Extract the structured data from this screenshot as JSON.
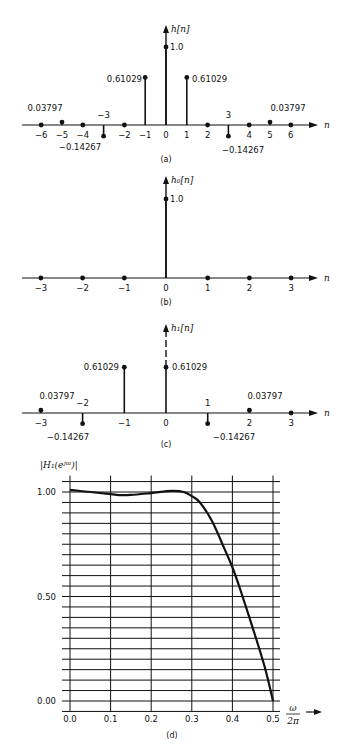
{
  "figure": {
    "panels": [
      {
        "id": "a",
        "caption": "(a)",
        "ylabel": "h[n]",
        "xlabel": "n",
        "peak_label": "1.0"
      },
      {
        "id": "b",
        "caption": "(b)",
        "ylabel": "h₀[n]",
        "xlabel": "n",
        "peak_label": "1.0"
      },
      {
        "id": "c",
        "caption": "(c)",
        "ylabel": "h₁[n]",
        "xlabel": "n"
      },
      {
        "id": "d",
        "caption": "(d)",
        "ylabel": "|H₁(eʲᵚ)|",
        "xlabel_num": "ω",
        "xlabel_den": "2π"
      }
    ]
  },
  "chart_data": [
    {
      "type": "stem",
      "title": "(a)",
      "ylabel": "h[n]",
      "xlabel": "n",
      "x": [
        -6,
        -5,
        -4,
        -3,
        -2,
        -1,
        0,
        1,
        2,
        3,
        4,
        5,
        6
      ],
      "values": [
        0,
        0.03797,
        0,
        -0.14267,
        0,
        0.61029,
        1.0,
        0.61029,
        0,
        -0.14267,
        0,
        0.03797,
        0
      ],
      "annotations": [
        "0.03797",
        "-0.14267",
        "0.61029",
        "1.0",
        "0.61029",
        "-0.14267",
        "0.03797",
        "-3",
        "3"
      ],
      "tick_labels": [
        "-6",
        "-5",
        "-4",
        "-2",
        "-1",
        "0",
        "1",
        "2",
        "4",
        "5",
        "6"
      ]
    },
    {
      "type": "stem",
      "title": "(b)",
      "ylabel": "h0[n]",
      "xlabel": "n",
      "x": [
        -3,
        -2,
        -1,
        0,
        1,
        2,
        3
      ],
      "values": [
        0,
        0,
        0,
        1.0,
        0,
        0,
        0
      ],
      "annotations": [
        "1.0"
      ],
      "tick_labels": [
        "-3",
        "-2",
        "-1",
        "0",
        "1",
        "2",
        "3"
      ]
    },
    {
      "type": "stem",
      "title": "(c)",
      "ylabel": "h1[n]",
      "xlabel": "n",
      "x": [
        -3,
        -2,
        -1,
        0,
        1,
        2,
        3
      ],
      "values": [
        0.03797,
        -0.14267,
        0.61029,
        0.61029,
        -0.14267,
        0.03797,
        0
      ],
      "annotations": [
        "0.03797",
        "-0.14267",
        "0.61029",
        "0.61029",
        "-0.14267",
        "0.03797",
        "-2",
        "1"
      ],
      "tick_labels": [
        "-3",
        "-1",
        "0",
        "2",
        "3"
      ]
    },
    {
      "type": "line",
      "title": "(d)",
      "ylabel": "|H1(e^jw)|",
      "xlabel": "w/2pi",
      "x": [
        0.0,
        0.05,
        0.1,
        0.12,
        0.15,
        0.2,
        0.25,
        0.28,
        0.3,
        0.32,
        0.35,
        0.38,
        0.4,
        0.42,
        0.45,
        0.48,
        0.5
      ],
      "values": [
        1.01,
        1.0,
        0.99,
        0.985,
        0.986,
        0.995,
        1.005,
        1.0,
        0.98,
        0.95,
        0.86,
        0.73,
        0.64,
        0.53,
        0.35,
        0.16,
        0.0
      ],
      "xticks": [
        "0.0",
        "0.1",
        "0.2",
        "0.3",
        "0.4",
        "0.5"
      ],
      "yticks": [
        "0.00",
        "0.50",
        "1.00"
      ],
      "xlim": [
        0.0,
        0.5
      ],
      "ylim": [
        -0.05,
        1.05
      ],
      "grid": true,
      "grid_y_step": 0.05,
      "grid_x_step": 0.1
    }
  ]
}
